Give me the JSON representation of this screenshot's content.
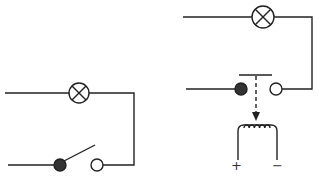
{
  "diagram": {
    "type": "circuit",
    "circuits": [
      {
        "name": "manual-switch-circuit",
        "components": [
          "lamp",
          "open-switch"
        ]
      },
      {
        "name": "relay-circuit",
        "components": [
          "lamp",
          "relay-contacts",
          "electromagnet-coil"
        ]
      }
    ],
    "coil_terminals": {
      "positive": "+",
      "negative": "−"
    },
    "colors": {
      "line": "#222222",
      "filled_contact": "#333333",
      "background": "#ffffff"
    }
  }
}
